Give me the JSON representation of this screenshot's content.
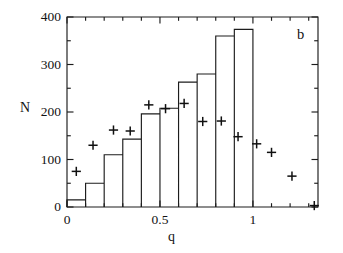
{
  "figure": {
    "panel_label": "b",
    "background_color": "#ffffff",
    "ink_color": "#1c1c1c"
  },
  "chart_data": {
    "type": "bar",
    "title": "",
    "subtitle": "",
    "panel_label": "b",
    "xlabel": "q",
    "ylabel": "N",
    "xlim": [
      0.0,
      1.35
    ],
    "ylim": [
      0,
      400
    ],
    "grid": false,
    "legend": null,
    "x_ticks_major": [
      0,
      0.5,
      1
    ],
    "x_tick_labels": [
      "0",
      "0.5",
      "1"
    ],
    "x_ticks_minor": [
      0.1,
      0.2,
      0.3,
      0.4,
      0.6,
      0.7,
      0.8,
      0.9,
      1.1,
      1.2,
      1.3
    ],
    "y_ticks_major": [
      0,
      100,
      200,
      300,
      400
    ],
    "y_tick_labels": [
      "0",
      "100",
      "200",
      "300",
      "400"
    ],
    "y_ticks_minor": [
      50,
      150,
      250,
      350
    ],
    "bin_width": 0.1,
    "bin_edges": [
      0.0,
      0.1,
      0.2,
      0.3,
      0.4,
      0.5,
      0.6,
      0.7,
      0.8,
      0.9,
      1.0
    ],
    "categories": [
      "0.0-0.1",
      "0.1-0.2",
      "0.2-0.3",
      "0.3-0.4",
      "0.4-0.5",
      "0.5-0.6",
      "0.6-0.7",
      "0.7-0.8",
      "0.8-0.9",
      "0.9-1.0"
    ],
    "values": [
      15,
      50,
      110,
      143,
      196,
      208,
      263,
      280,
      360,
      374
    ],
    "series": [
      {
        "name": "histogram",
        "style": "step-outline",
        "values": [
          15,
          50,
          110,
          143,
          196,
          208,
          263,
          280,
          360,
          374
        ]
      },
      {
        "name": "plus-markers",
        "style": "plus",
        "x": [
          0.05,
          0.14,
          0.25,
          0.34,
          0.44,
          0.53,
          0.63,
          0.73,
          0.83,
          0.92,
          1.02,
          1.1,
          1.21,
          1.33
        ],
        "values": [
          75,
          130,
          162,
          160,
          215,
          207,
          218,
          180,
          181,
          148,
          133,
          115,
          65,
          3
        ]
      }
    ]
  }
}
